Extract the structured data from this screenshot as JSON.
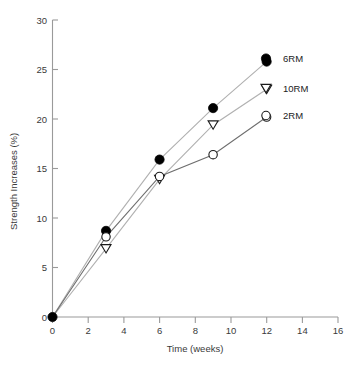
{
  "chart_data": {
    "type": "line",
    "title": "",
    "xlabel": "Time (weeks)",
    "ylabel": "Strength Increases (%)",
    "xlim": [
      0,
      16
    ],
    "ylim": [
      0,
      30
    ],
    "xticks": [
      0,
      2,
      4,
      6,
      8,
      10,
      12,
      14,
      16
    ],
    "yticks": [
      0,
      5,
      10,
      15,
      20,
      25,
      30
    ],
    "xtick_labels": [
      "0",
      "2",
      "4",
      "6",
      "8",
      "10",
      "12",
      "14",
      "16"
    ],
    "ytick_labels": [
      "0",
      "5",
      "10",
      "15",
      "20",
      "25",
      "30"
    ],
    "grid": false,
    "legend_position": "right-inline",
    "x": [
      0,
      3,
      6,
      9,
      12
    ],
    "series": [
      {
        "name": "6RM",
        "marker": "filled-circle",
        "values": [
          0,
          8.7,
          15.9,
          21.1,
          25.8
        ]
      },
      {
        "name": "10RM",
        "marker": "open-triangle-down",
        "values": [
          0,
          6.9,
          13.9,
          19.4,
          23.0
        ]
      },
      {
        "name": "2RM",
        "marker": "open-circle",
        "values": [
          0,
          8.1,
          14.2,
          16.4,
          20.2
        ]
      }
    ]
  },
  "axes": {
    "x_title": "Time (weeks)",
    "y_title": "Strength Increases (%)",
    "x_tick_0": "0",
    "x_tick_2": "2",
    "x_tick_4": "4",
    "x_tick_6": "6",
    "x_tick_8": "8",
    "x_tick_10": "10",
    "x_tick_12": "12",
    "x_tick_14": "14",
    "x_tick_16": "16",
    "y_tick_0": "0",
    "y_tick_5": "5",
    "y_tick_10": "10",
    "y_tick_15": "15",
    "y_tick_20": "20",
    "y_tick_25": "25",
    "y_tick_30": "30"
  },
  "legend": {
    "items": [
      {
        "label": "6RM"
      },
      {
        "label": "10RM"
      },
      {
        "label": "2RM"
      }
    ]
  },
  "colors": {
    "axis": "#9a9a9a",
    "line": "#b0b0b0",
    "line_dark": "#6e6e6e",
    "marker_filled": "#000000",
    "marker_open_stroke": "#1a1a1a",
    "marker_open_fill": "#ffffff",
    "text": "#3a3a3a",
    "background": "#ffffff"
  }
}
